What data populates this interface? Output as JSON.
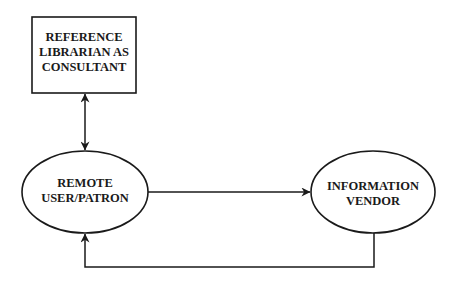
{
  "diagram": {
    "nodes": [
      {
        "id": "reference-librarian",
        "shape": "rectangle",
        "lines": [
          "REFERENCE",
          "LIBRARIAN AS",
          "CONSULTANT"
        ]
      },
      {
        "id": "remote-user",
        "shape": "ellipse",
        "lines": [
          "REMOTE",
          "USER/PATRON"
        ]
      },
      {
        "id": "information-vendor",
        "shape": "ellipse",
        "lines": [
          "INFORMATION",
          "VENDOR"
        ]
      }
    ],
    "edges": [
      {
        "from": "reference-librarian",
        "to": "remote-user",
        "direction": "bidirectional"
      },
      {
        "from": "remote-user",
        "to": "information-vendor",
        "direction": "forward"
      },
      {
        "from": "information-vendor",
        "to": "remote-user",
        "direction": "forward",
        "route": "below"
      }
    ],
    "colors": {
      "stroke": "#1a1a1a",
      "background": "#ffffff"
    }
  }
}
